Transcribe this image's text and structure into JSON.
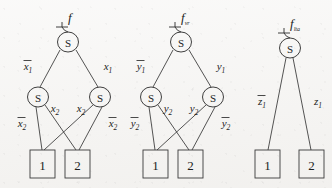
{
  "figure": {
    "title_glyphs": {
      "node_symbol": "S",
      "terminal_low": "1",
      "terminal_high": "2"
    },
    "trees": [
      {
        "id": "left",
        "function_label": "f",
        "function_subscript": "",
        "root": {
          "label": "S"
        },
        "level1_nodes": [
          {
            "label": "S"
          },
          {
            "label": "S"
          }
        ],
        "terminals": [
          {
            "label": "1"
          },
          {
            "label": "2"
          }
        ],
        "root_edges": [
          {
            "label_base": "x",
            "label_sub": "1",
            "overline": true
          },
          {
            "label_base": "x",
            "label_sub": "1",
            "overline": false
          }
        ],
        "level1_edges": [
          {
            "label_base": "x",
            "label_sub": "2",
            "overline": true
          },
          {
            "label_base": "x",
            "label_sub": "2",
            "overline": false
          },
          {
            "label_base": "x",
            "label_sub": "2",
            "overline": false
          },
          {
            "label_base": "x",
            "label_sub": "2",
            "overline": true
          }
        ]
      },
      {
        "id": "middle",
        "function_label": "f",
        "function_subscript": "vr",
        "root": {
          "label": "S"
        },
        "level1_nodes": [
          {
            "label": "S"
          },
          {
            "label": "S"
          }
        ],
        "terminals": [
          {
            "label": "1"
          },
          {
            "label": "2"
          }
        ],
        "root_edges": [
          {
            "label_base": "y",
            "label_sub": "1",
            "overline": true
          },
          {
            "label_base": "y",
            "label_sub": "1",
            "overline": false
          }
        ],
        "level1_edges": [
          {
            "label_base": "y",
            "label_sub": "2",
            "overline": true
          },
          {
            "label_base": "y",
            "label_sub": "2",
            "overline": false
          },
          {
            "label_base": "y",
            "label_sub": "2",
            "overline": false
          },
          {
            "label_base": "y",
            "label_sub": "2",
            "overline": true
          }
        ]
      },
      {
        "id": "right",
        "function_label": "f",
        "function_subscript": "lta",
        "root": {
          "label": "S"
        },
        "level1_nodes": [],
        "terminals": [
          {
            "label": "1"
          },
          {
            "label": "2"
          }
        ],
        "root_edges": [
          {
            "label_base": "z",
            "label_sub": "1",
            "overline": true
          },
          {
            "label_base": "z",
            "label_sub": "1",
            "overline": false
          }
        ],
        "level1_edges": []
      }
    ],
    "colors": {
      "ink": "#1d1d1d",
      "stroke": "#2a2a2a",
      "background": "#f4f3f1"
    }
  }
}
